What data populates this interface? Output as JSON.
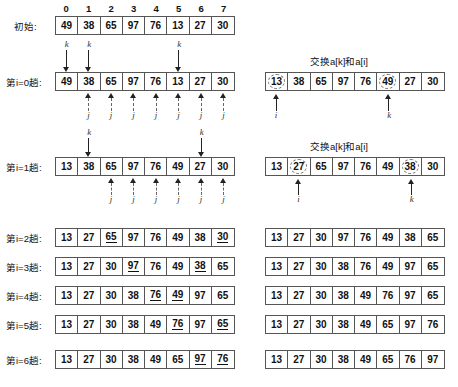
{
  "figure": {
    "indices": [
      "0",
      "1",
      "2",
      "3",
      "4",
      "5",
      "6",
      "7"
    ],
    "swap_caption": "交换a[k]和a[i]",
    "initial_label": "初始:",
    "k_label": "k",
    "j_label": "j",
    "i_label": "i"
  },
  "rows": {
    "initial": {
      "label": "初始:",
      "values": [
        "49",
        "38",
        "65",
        "97",
        "76",
        "13",
        "27",
        "30"
      ],
      "underline": [],
      "circled": []
    },
    "pass0": {
      "label_prefix": "第",
      "label_var": "i",
      "label_eq": "=0",
      "label_suffix": "趟:",
      "label": "第i=0趟:",
      "values": [
        "49",
        "38",
        "65",
        "97",
        "76",
        "13",
        "27",
        "30"
      ],
      "underline": [],
      "k_marks_above": [
        0,
        1,
        5
      ],
      "j_marks_below": [
        1,
        2,
        3,
        4,
        5,
        6,
        7
      ]
    },
    "pass0_result": {
      "caption": "交换a[k]和a[i]",
      "values": [
        "13",
        "38",
        "65",
        "97",
        "76",
        "49",
        "27",
        "30"
      ],
      "circled": [
        0,
        5
      ],
      "pointers_below": [
        {
          "index": 0,
          "label": "i"
        },
        {
          "index": 5,
          "label": "k"
        }
      ]
    },
    "pass1": {
      "label": "第i=1趟:",
      "values": [
        "13",
        "38",
        "65",
        "97",
        "76",
        "49",
        "27",
        "30"
      ],
      "underline": [],
      "k_marks_above": [
        1,
        6
      ],
      "j_marks_below": [
        2,
        3,
        4,
        5,
        6,
        7
      ]
    },
    "pass1_result": {
      "caption": "交换a[k]和a[i]",
      "values": [
        "13",
        "27",
        "65",
        "97",
        "76",
        "49",
        "38",
        "30"
      ],
      "circled": [
        1,
        6
      ],
      "pointers_below": [
        {
          "index": 1,
          "label": "i"
        },
        {
          "index": 6,
          "label": "k"
        }
      ]
    },
    "pass2": {
      "label": "第i=2趟:",
      "values": [
        "13",
        "27",
        "65",
        "97",
        "76",
        "49",
        "38",
        "30"
      ],
      "underline": [
        2,
        7
      ]
    },
    "pass2_result": {
      "values": [
        "13",
        "27",
        "30",
        "97",
        "76",
        "49",
        "38",
        "65"
      ],
      "underline": []
    },
    "pass3": {
      "label": "第i=3趟:",
      "values": [
        "13",
        "27",
        "30",
        "97",
        "76",
        "49",
        "38",
        "65"
      ],
      "underline": [
        3,
        6
      ]
    },
    "pass3_result": {
      "values": [
        "13",
        "27",
        "30",
        "38",
        "76",
        "49",
        "97",
        "65"
      ],
      "underline": []
    },
    "pass4": {
      "label": "第i=4趟:",
      "values": [
        "13",
        "27",
        "30",
        "38",
        "76",
        "49",
        "97",
        "65"
      ],
      "underline": [
        4,
        5
      ]
    },
    "pass4_result": {
      "values": [
        "13",
        "27",
        "30",
        "38",
        "49",
        "76",
        "97",
        "65"
      ],
      "underline": []
    },
    "pass5": {
      "label": "第i=5趟:",
      "values": [
        "13",
        "27",
        "30",
        "38",
        "49",
        "76",
        "97",
        "65"
      ],
      "underline": [
        5,
        7
      ]
    },
    "pass5_result": {
      "values": [
        "13",
        "27",
        "30",
        "38",
        "49",
        "65",
        "97",
        "76"
      ],
      "underline": []
    },
    "pass6": {
      "label": "第i=6趟:",
      "values": [
        "13",
        "27",
        "30",
        "38",
        "49",
        "65",
        "97",
        "76"
      ],
      "underline": [
        6,
        7
      ]
    },
    "pass6_result": {
      "values": [
        "13",
        "27",
        "30",
        "38",
        "49",
        "65",
        "76",
        "97"
      ],
      "underline": []
    }
  }
}
